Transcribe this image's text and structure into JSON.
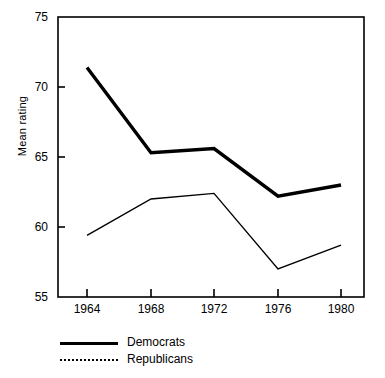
{
  "chart_data": {
    "type": "line",
    "title": "",
    "xlabel": "",
    "ylabel": "Mean rating",
    "categories": [
      "1964",
      "1968",
      "1972",
      "1976",
      "1980"
    ],
    "x": [
      1964,
      1968,
      1972,
      1976,
      1980
    ],
    "xlim": [
      1962,
      1982
    ],
    "ylim": [
      55,
      75
    ],
    "yticks": [
      55,
      60,
      65,
      70,
      75
    ],
    "ytick_labels": [
      "55",
      "60",
      "65",
      "70",
      "75"
    ],
    "xticks": [
      1964,
      1968,
      1972,
      1976,
      1980
    ],
    "xtick_labels": [
      "1964",
      "1968",
      "1972",
      "1976",
      "1980"
    ],
    "grid": false,
    "legend_position": "below-left",
    "series": [
      {
        "name": "Democrats",
        "style": "solid-thick",
        "color": "#000000",
        "values": [
          71.4,
          65.3,
          65.6,
          62.2,
          63.0
        ]
      },
      {
        "name": "Republicans",
        "style": "thin",
        "legend_style": "dotted",
        "color": "#000000",
        "values": [
          59.4,
          62.0,
          62.4,
          57.0,
          58.7
        ]
      }
    ]
  },
  "axis": {
    "ylabel": "Mean rating"
  },
  "legend": {
    "items": [
      {
        "label": "Democrats",
        "swatch": "solid-line-swatch"
      },
      {
        "label": "Republicans",
        "swatch": "dotted-line-swatch"
      }
    ]
  }
}
